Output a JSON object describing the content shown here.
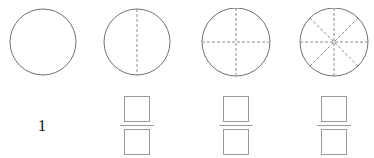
{
  "worksheet": {
    "title": "Fraction circle models with answer boxes",
    "background_color": "#ffffff",
    "circle_stroke_color": "#6f6f78",
    "divider_color": "#8c8c94",
    "box_stroke_color": "#9a9a9a",
    "text_color": "#1a1a1a"
  },
  "models": [
    {
      "id": "model-whole",
      "name": "whole-circle",
      "parts": 1,
      "divider_angles_deg": [],
      "answer_type": "number",
      "answer_value": "1",
      "numerator_value": "",
      "denominator_value": ""
    },
    {
      "id": "model-halves",
      "name": "circle-divided-in-halves",
      "parts": 2,
      "divider_angles_deg": [
        90
      ],
      "answer_type": "fraction",
      "answer_value": "",
      "numerator_value": "",
      "denominator_value": ""
    },
    {
      "id": "model-quarters",
      "name": "circle-divided-in-quarters",
      "parts": 4,
      "divider_angles_deg": [
        0,
        90
      ],
      "answer_type": "fraction",
      "answer_value": "",
      "numerator_value": "",
      "denominator_value": ""
    },
    {
      "id": "model-eighths",
      "name": "circle-divided-in-eighths",
      "parts": 8,
      "divider_angles_deg": [
        0,
        45,
        90,
        135
      ],
      "answer_type": "fraction",
      "answer_value": "",
      "numerator_value": "",
      "denominator_value": ""
    }
  ]
}
